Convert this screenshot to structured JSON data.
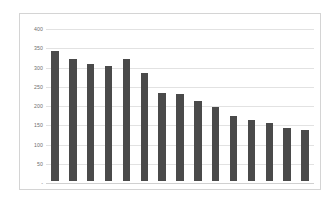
{
  "chart_data": {
    "type": "bar",
    "title": "",
    "subtitle": "",
    "xlabel": "",
    "ylabel": "",
    "categories": [
      "1",
      "2",
      "3",
      "4",
      "5",
      "6",
      "7",
      "8",
      "9",
      "10",
      "11",
      "12",
      "13",
      "14",
      "15"
    ],
    "values": [
      338,
      318,
      304,
      298,
      318,
      280,
      229,
      226,
      207,
      192,
      168,
      158,
      151,
      137,
      132
    ],
    "series": [
      {
        "name": "Series 1",
        "values": [
          338,
          318,
          304,
          298,
          318,
          280,
          229,
          226,
          207,
          192,
          168,
          158,
          151,
          137,
          132
        ]
      }
    ],
    "ylim": [
      0,
      400
    ],
    "ytick_step": 50,
    "ytick_labels": [
      "400",
      "350",
      "300",
      "250",
      "200",
      "150",
      "100",
      "50",
      "-"
    ],
    "ytick_values": [
      400,
      350,
      300,
      250,
      200,
      150,
      100,
      50,
      0
    ],
    "grid": true,
    "grid_axis": "y",
    "legend": false,
    "legend_position": "none",
    "x_tick_labels_visible": false,
    "colors": {
      "bar": "#4a4a4a",
      "gridline": "#e2e2e2",
      "axis": "#d0d0d0",
      "tick_label": "#6e6e6e",
      "plot_background": "#ffffff",
      "chart_border": "#d4d4d4",
      "page_background": "#ffffff"
    }
  }
}
